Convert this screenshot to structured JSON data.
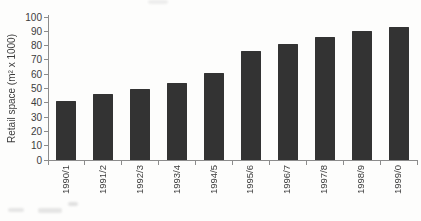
{
  "chart_data": {
    "type": "bar",
    "title": "",
    "xlabel": "",
    "ylabel": "Retail space (m² x 1000)",
    "categories": [
      "1990/1",
      "1991/2",
      "1992/3",
      "1993/4",
      "1994/5",
      "1995/6",
      "1996/7",
      "1997/8",
      "1998/9",
      "1999/0"
    ],
    "values": [
      41,
      46,
      50,
      54,
      61,
      76,
      81,
      86,
      90,
      93
    ],
    "ylim": [
      0,
      100
    ],
    "yticks": [
      0,
      10,
      20,
      30,
      40,
      50,
      60,
      70,
      80,
      90,
      100
    ],
    "grid": false,
    "legend": null,
    "bar_color": "#333333",
    "axis_color": "#8c8c8c",
    "text_color": "#3c3c3c",
    "background_color": "#fdfdfc"
  }
}
